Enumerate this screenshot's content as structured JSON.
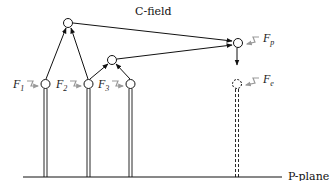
{
  "diagram": {
    "labels": {
      "c_field": "C-field",
      "p_plane": "P-plane"
    },
    "forces": [
      {
        "id": "F1",
        "symbol": "F",
        "subscript": "1"
      },
      {
        "id": "F2",
        "symbol": "F",
        "subscript": "2"
      },
      {
        "id": "F3",
        "symbol": "F",
        "subscript": "3"
      },
      {
        "id": "Fp",
        "symbol": "F",
        "subscript": "p"
      },
      {
        "id": "Fe",
        "symbol": "F",
        "subscript": "e"
      }
    ],
    "nodes": [
      {
        "id": "top",
        "type": "solid"
      },
      {
        "id": "mid",
        "type": "solid"
      },
      {
        "id": "target",
        "type": "solid"
      },
      {
        "id": "n1",
        "type": "solid"
      },
      {
        "id": "n2",
        "type": "solid"
      },
      {
        "id": "n3",
        "type": "solid"
      },
      {
        "id": "emerging",
        "type": "dashed"
      }
    ],
    "colors": {
      "line": "#111111",
      "force_arrow": "#9a9a9a",
      "force_label": "#333333"
    }
  }
}
